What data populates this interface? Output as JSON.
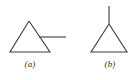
{
  "figure": {
    "background_color": "#ffffff",
    "stroke_color": "#3c3c3c",
    "stroke_width": 1.1,
    "width": 140,
    "height": 80,
    "panels": [
      {
        "id": "a",
        "label": "(a)",
        "label_style": "italic",
        "description": "triangle with horizontal line attached to right edge",
        "triangle": {
          "apex": [
            29,
            21
          ],
          "base_left": [
            10,
            52
          ],
          "base_right": [
            50,
            52
          ],
          "points": "29,21 10,52 50,52 29,21"
        },
        "attached_line": {
          "name": "horizontal-line",
          "x1": 39,
          "y1": 37,
          "x2": 66,
          "y2": 37
        }
      },
      {
        "id": "b",
        "label": "(b)",
        "label_style": "italic",
        "description": "triangle with vertical line rising from apex",
        "triangle": {
          "apex": [
            109,
            24
          ],
          "base_left": [
            91,
            52
          ],
          "base_right": [
            127,
            52
          ],
          "points": "109,24 91,52 127,52 109,24"
        },
        "attached_line": {
          "name": "vertical-line",
          "x1": 109,
          "y1": 6,
          "x2": 109,
          "y2": 24
        }
      }
    ]
  }
}
